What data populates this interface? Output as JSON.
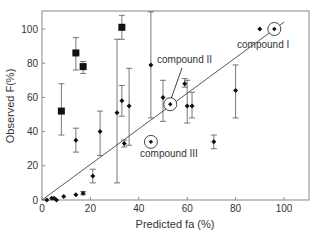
{
  "chart_data": {
    "type": "scatter",
    "title": "",
    "xlabel": "Predicted fa (%)",
    "ylabel": "Observed F(%)",
    "xlim": [
      0,
      110
    ],
    "ylim": [
      0,
      110
    ],
    "xticks": [
      0,
      20,
      40,
      60,
      80,
      100
    ],
    "yticks": [
      0,
      20,
      40,
      60,
      80,
      100
    ],
    "grid": false,
    "legend": null,
    "regression_line": {
      "x": [
        0,
        100
      ],
      "y": [
        0,
        104
      ]
    },
    "series": [
      {
        "name": "squares",
        "marker": "square",
        "points": [
          {
            "x": 8,
            "y": 52,
            "lo": 38,
            "hi": 68
          },
          {
            "x": 14,
            "y": 86,
            "lo": 76,
            "hi": 95
          },
          {
            "x": 17,
            "y": 78,
            "lo": 74,
            "hi": 81
          },
          {
            "x": 33,
            "y": 101,
            "lo": 94,
            "hi": 108
          }
        ]
      },
      {
        "name": "diamonds",
        "marker": "diamond",
        "points": [
          {
            "x": 2,
            "y": 0
          },
          {
            "x": 4,
            "y": 1
          },
          {
            "x": 5,
            "y": 1
          },
          {
            "x": 6,
            "y": 0
          },
          {
            "x": 9,
            "y": 2
          },
          {
            "x": 14,
            "y": 3
          },
          {
            "x": 17,
            "y": 4,
            "lo": 3,
            "hi": 5
          },
          {
            "x": 14,
            "y": 35,
            "lo": 28,
            "hi": 42
          },
          {
            "x": 21,
            "y": 14,
            "lo": 10,
            "hi": 18
          },
          {
            "x": 24,
            "y": 40,
            "lo": 26,
            "hi": 52
          },
          {
            "x": 31,
            "y": 51,
            "lo": 10,
            "hi": 94
          },
          {
            "x": 33,
            "y": 58,
            "lo": 49,
            "hi": 67
          },
          {
            "x": 34,
            "y": 33,
            "lo": 31,
            "hi": 35
          },
          {
            "x": 36,
            "y": 55,
            "lo": 32,
            "hi": 77
          },
          {
            "x": 45,
            "y": 79,
            "lo": 48,
            "hi": 110
          },
          {
            "x": 50,
            "y": 60,
            "lo": 46,
            "hi": 70
          },
          {
            "x": 59,
            "y": 68,
            "lo": 66,
            "hi": 71
          },
          {
            "x": 60,
            "y": 55,
            "lo": 45,
            "hi": 70
          },
          {
            "x": 62,
            "y": 55,
            "lo": 48,
            "hi": 63
          },
          {
            "x": 71,
            "y": 34,
            "lo": 30,
            "hi": 38
          },
          {
            "x": 80,
            "y": 64,
            "lo": 48,
            "hi": 79
          },
          {
            "x": 90,
            "y": 100
          }
        ]
      },
      {
        "name": "highlighted compounds",
        "marker": "circled",
        "points": [
          {
            "x": 96,
            "y": 100,
            "label": "compound I"
          },
          {
            "x": 53,
            "y": 56,
            "label": "compound II"
          },
          {
            "x": 45,
            "y": 34,
            "label": "compound III"
          }
        ]
      }
    ],
    "annotations": [
      "compound I",
      "compound II",
      "compound III"
    ]
  }
}
